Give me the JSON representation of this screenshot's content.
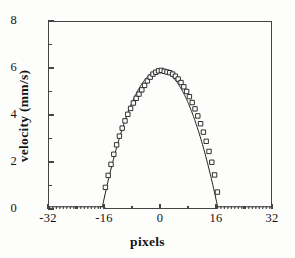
{
  "figure": {
    "background_color": "#fdfdfb",
    "axis_color": "#444444",
    "line_color": "#1a1a1a",
    "marker_color": "#1a1a1a"
  },
  "chart_data": {
    "type": "scatter",
    "title": "",
    "subtitle": "",
    "xlabel": "pixels",
    "ylabel": "velocity (mm/s)",
    "xlim": [
      -32,
      32
    ],
    "ylim": [
      0,
      8
    ],
    "grid": false,
    "legend": null,
    "x_ticks": [
      -32,
      -16,
      0,
      16,
      32
    ],
    "x_tick_labels": [
      "-32",
      "-16",
      "0",
      "16",
      "32"
    ],
    "x_minor_ticks": [
      -24,
      -8,
      8,
      24
    ],
    "y_ticks": [
      0,
      2,
      4,
      6,
      8
    ],
    "y_tick_labels": [
      "0",
      "2",
      "4",
      "6",
      "8"
    ],
    "y_minor_ticks": [
      1,
      3,
      5,
      7
    ],
    "marker": "open-square",
    "marker_size": 4.4,
    "series": [
      {
        "name": "measured velocity",
        "style": "markers",
        "x": [
          -32,
          -31,
          -30,
          -29,
          -28,
          -27,
          -26,
          -25,
          -24,
          -23,
          -22,
          -21,
          -20,
          -19,
          -18,
          -17,
          -16.4,
          -15.6,
          -14.8,
          -14.0,
          -13.2,
          -12.4,
          -11.6,
          -10.8,
          -10.0,
          -9.2,
          -8.4,
          -7.6,
          -6.8,
          -6.0,
          -5.2,
          -4.4,
          -3.6,
          -2.8,
          -2.0,
          -1.2,
          -0.4,
          0.4,
          1.2,
          2.0,
          2.8,
          3.6,
          4.4,
          5.2,
          6.0,
          6.8,
          7.6,
          8.4,
          9.2,
          10.0,
          10.8,
          11.6,
          12.4,
          13.2,
          14.0,
          14.8,
          15.6,
          16.4,
          17,
          18,
          19,
          20,
          21,
          22,
          23,
          24,
          25,
          26,
          27,
          28,
          29,
          30,
          31,
          32
        ],
        "y": [
          0,
          0,
          0,
          0,
          0,
          0,
          0,
          0,
          0,
          0,
          0,
          0,
          0,
          0,
          0,
          0,
          0,
          0.92,
          1.43,
          1.9,
          2.33,
          2.73,
          3.1,
          3.44,
          3.75,
          4.03,
          4.28,
          4.51,
          4.71,
          4.89,
          5.07,
          5.26,
          5.45,
          5.61,
          5.74,
          5.82,
          5.88,
          5.9,
          5.86,
          5.83,
          5.8,
          5.74,
          5.65,
          5.53,
          5.38,
          5.2,
          5.0,
          4.78,
          4.53,
          4.26,
          3.96,
          3.63,
          3.27,
          2.88,
          2.45,
          1.99,
          1.45,
          0.72,
          0,
          0,
          0,
          0,
          0,
          0,
          0,
          0,
          0,
          0,
          0,
          0,
          0,
          0,
          0,
          0
        ]
      },
      {
        "name": "parabolic fit",
        "style": "line",
        "comment": "v(x) = 5.90 * (1 - (x/16.6)^2) for |x| <= 16.6, else 0",
        "peak_value": 5.9,
        "half_width": 16.6,
        "x": [
          -32,
          -16.6,
          -16,
          -15,
          -14,
          -13,
          -12,
          -11,
          -10,
          -9,
          -8,
          -7,
          -6,
          -5,
          -4,
          -3,
          -2,
          -1,
          0,
          1,
          2,
          3,
          4,
          5,
          6,
          7,
          8,
          9,
          10,
          11,
          12,
          13,
          14,
          15,
          16,
          16.6,
          32
        ],
        "y": [
          0,
          0,
          0.42,
          1.12,
          1.7,
          2.22,
          2.69,
          3.12,
          3.5,
          3.85,
          4.17,
          4.45,
          4.69,
          4.9,
          5.06,
          5.19,
          5.29,
          5.39,
          5.9,
          5.39,
          5.29,
          5.19,
          5.06,
          4.9,
          4.69,
          4.45,
          4.17,
          3.85,
          3.5,
          3.12,
          2.69,
          2.22,
          1.7,
          1.12,
          0.42,
          0,
          0
        ]
      }
    ]
  }
}
